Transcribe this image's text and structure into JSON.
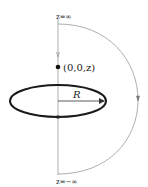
{
  "diagram": {
    "top_label": "z=∞",
    "bottom_label": "z=−∞",
    "point_label": "(0,0,z)",
    "radius_label": "R",
    "colors": {
      "loop": "#1a1a1a",
      "axis": "#9a9a9a",
      "arc": "#9a9a9a",
      "point": "#111111"
    }
  }
}
